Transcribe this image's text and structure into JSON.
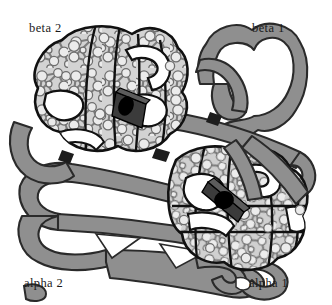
{
  "figure": {
    "background_color": "#ffffff",
    "width": 332,
    "height": 305
  },
  "labels": {
    "beta_2": "beta 2",
    "beta_1": "beta 1",
    "alpha_2": "alpha 2",
    "alpha_1": "alpha 1"
  },
  "colors": {
    "background": "#ffffff",
    "ribbon_fill": "#8f8f8f",
    "ribbon_fill_dark": "#7a7a7a",
    "globule_fill": "#cfcfcf",
    "globule_fill_light": "#d8d8d8",
    "atom_fill": "#e8e8e8",
    "atom_stroke": "#6e6e6e",
    "bond_stroke": "#7d7d7d",
    "outline": "#111111",
    "heme_plate": "#3b3b3b",
    "heme_plate_light": "#575757",
    "heme_iron": "#000000",
    "label_text": "#1a1a1a"
  },
  "subunits": [
    {
      "id": "beta-2",
      "label": "beta 2",
      "position": "top-left",
      "render_style": "space-filling-globule-with-atoms",
      "fill": "#cfcfcf",
      "has_heme": true
    },
    {
      "id": "beta-1",
      "label": "beta 1",
      "position": "top-right",
      "render_style": "folded-ribbon",
      "fill": "#8f8f8f",
      "has_heme": false
    },
    {
      "id": "alpha-2",
      "label": "alpha 2",
      "position": "bottom-left",
      "render_style": "folded-ribbon",
      "fill": "#8f8f8f",
      "has_heme": false
    },
    {
      "id": "alpha-1",
      "label": "alpha 1",
      "position": "bottom-right",
      "render_style": "space-filling-globule-with-atoms",
      "fill": "#cfcfcf",
      "has_heme": true
    }
  ],
  "heme_groups": [
    {
      "id": "heme-beta-2",
      "subunit": "beta-2",
      "iron_label": "Fe"
    },
    {
      "id": "heme-alpha-1",
      "subunit": "alpha-1",
      "iron_label": "Fe"
    }
  ]
}
